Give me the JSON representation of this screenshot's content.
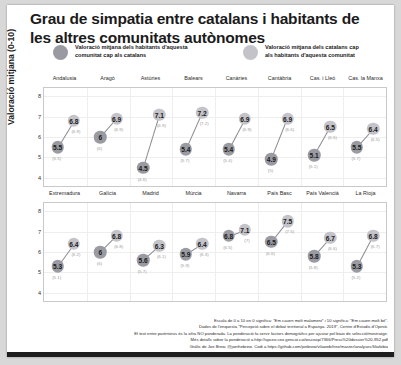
{
  "title": "Grau de simpatia entre catalans i habitants\nde les altres comunitats autònomes",
  "legend": {
    "items": [
      {
        "label": "Valoració mitjana dels habitants d'aquesta\ncomunitat cap als catalans",
        "color": "#9a9aa2",
        "key": "a"
      },
      {
        "label": "Valoració mitjana dels catalans cap\nals habitants d'aquesta comunitat",
        "color": "#c3c3c9",
        "key": "b"
      }
    ]
  },
  "axis": {
    "ylabel": "Valoració mitjana (0-10)",
    "yticks": [
      "8",
      "7",
      "6",
      "5",
      "4"
    ],
    "ymin": 3.6,
    "ymax": 8.4
  },
  "footer": {
    "lines": [
      "Escala de 0 a 10 on 0 significa: \"Em cauen molt malament\" i 10 significa: \"Em cauen molt bé\".",
      "Dades de l'enquesta \"Percepció sobre el debat territorial a Espanya. 2019\", Centre d'Estudis d'Opinió.",
      "El text entre parèntesis és la xifra NO ponderada. La ponderació fa servir factors demogràfics per ajustar pel biaix de selecció/mostratge.",
      "Més detalls sobre la ponderació a http://upceo.ceo.gencat.cat/wsceop/7366/Press%20dossier%20-952.pdf",
      "Gràfic de Joe Brew, @joethebrew. Codi a https://github.com/joebrew/vilaweb/tree/master/analyses/filiafobia"
    ]
  },
  "chart_data": {
    "type": "scatter",
    "title": "Grau de simpatia entre catalans i habitants de les altres comunitats autònomes",
    "subtitle": "",
    "xlabel": "",
    "ylabel": "Valoració mitjana (0-10)",
    "ylim": [
      3.6,
      8.4
    ],
    "grid": true,
    "legend_position": "top",
    "facet_rows": 2,
    "facet_cols": 8,
    "series": [
      {
        "name": "Valoració mitjana dels habitants d'aquesta comunitat cap als catalans",
        "color": "#9a9aa2"
      },
      {
        "name": "Valoració mitjana dels catalans cap als habitants d'aquesta comunitat",
        "color": "#c3c3c9"
      }
    ],
    "panels": [
      {
        "name": "Andalusia",
        "a": 5.5,
        "a_raw": "(5.5)",
        "b": 6.8,
        "b_raw": "(6.9)"
      },
      {
        "name": "Aragó",
        "a": 6.0,
        "a_raw": "(6)",
        "b": 6.9,
        "b_raw": "(6.9)"
      },
      {
        "name": "Astúries",
        "a": 4.5,
        "a_raw": "(4.6)",
        "b": 7.1,
        "b_raw": "(6.9)"
      },
      {
        "name": "Balears",
        "a": 5.4,
        "a_raw": "(5.7)",
        "b": 7.2,
        "b_raw": "(7.2)"
      },
      {
        "name": "Canàries",
        "a": 5.4,
        "a_raw": "(5.4)",
        "b": 6.9,
        "b_raw": "(6.9)"
      },
      {
        "name": "Cantàbria",
        "a": 4.9,
        "a_raw": "(5)",
        "b": 6.9,
        "b_raw": "(6.6)"
      },
      {
        "name": "Cas. i Lleó",
        "a": 5.1,
        "a_raw": "(5.1)",
        "b": 6.5,
        "b_raw": "(6.5)"
      },
      {
        "name": "Cas. la Manxa",
        "a": 5.5,
        "a_raw": "(5.7)",
        "b": 6.4,
        "b_raw": "(6.5)"
      },
      {
        "name": "Extremadura",
        "a": 5.3,
        "a_raw": "(5.1)",
        "b": 6.4,
        "b_raw": "(6.2)"
      },
      {
        "name": "Galícia",
        "a": 6.0,
        "a_raw": "(6)",
        "b": 6.8,
        "b_raw": "(6.8)"
      },
      {
        "name": "Madrid",
        "a": 5.6,
        "a_raw": "(5.7)",
        "b": 6.3,
        "b_raw": "(6.1)"
      },
      {
        "name": "Múrcia",
        "a": 5.9,
        "a_raw": "(5.9)",
        "b": 6.4,
        "b_raw": "(6.3)"
      },
      {
        "name": "Navarra",
        "a": 6.8,
        "a_raw": "(6.5)",
        "b": 7.1,
        "b_raw": "(7)"
      },
      {
        "name": "País Basc",
        "a": 6.5,
        "a_raw": "(6.6)",
        "b": 7.5,
        "b_raw": "(7.5)"
      },
      {
        "name": "País Valencià",
        "a": 5.8,
        "a_raw": "(5.8)",
        "b": 6.7,
        "b_raw": "(6.6)"
      },
      {
        "name": "La Rioja",
        "a": 5.3,
        "a_raw": "(5.2)",
        "b": 6.8,
        "b_raw": "(6.7)"
      }
    ]
  }
}
